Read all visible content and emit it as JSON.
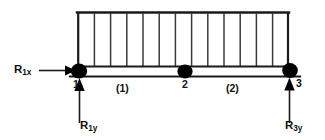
{
  "diagram": {
    "type": "beam-free-body-diagram",
    "background_color": "#ffffff",
    "line_color": "#1a1a1a",
    "node_color": "#000000",
    "beam": {
      "x_start": 78,
      "x_end": 290,
      "top_line_y": 66,
      "bottom_line_y": 76
    },
    "distributed_load": {
      "label": "uniform-distributed-load",
      "top_y": 12,
      "bottom_y": 66,
      "x_start": 78,
      "x_end": 288,
      "hatch_count": 14,
      "hatch_spacing": 16.2
    },
    "nodes": [
      {
        "name": "node-1",
        "label": "1",
        "x": 79,
        "y": 71
      },
      {
        "name": "node-2",
        "label": "2",
        "x": 185,
        "y": 71
      },
      {
        "name": "node-3",
        "label": "3",
        "x": 290,
        "y": 71
      }
    ],
    "elements": [
      {
        "name": "element-1",
        "label": "(1)"
      },
      {
        "name": "element-2",
        "label": "(2)"
      }
    ],
    "reactions": [
      {
        "name": "reaction-R1x",
        "symbol": "R",
        "subscript": "1x",
        "direction": "horizontal-right",
        "applied_at_node": "1"
      },
      {
        "name": "reaction-R1y",
        "symbol": "R",
        "subscript": "1y",
        "direction": "vertical-up",
        "applied_at_node": "1"
      },
      {
        "name": "reaction-R3y",
        "symbol": "R",
        "subscript": "3y",
        "direction": "vertical-up",
        "applied_at_node": "3"
      }
    ]
  }
}
